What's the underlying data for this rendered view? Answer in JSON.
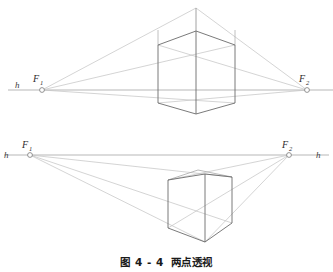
{
  "figure": {
    "caption_number": "图 4 - 4",
    "caption_title": "两点透视",
    "background_color": "#ffffff"
  },
  "colors": {
    "solid_edge": "#6b6b6b",
    "construction_line": "#bcbcbc",
    "horizon_line": "#9a9a9a",
    "label_text": "#2b2b2b",
    "marker_stroke": "#7a7a7a"
  },
  "diagrams": [
    {
      "id": "upper-diagram",
      "name": "worms-eye-two-point-perspective",
      "description": "Two-point perspective of a box straddling the horizon line",
      "horizon": {
        "label_left": "h",
        "y": 90,
        "x_start": 8,
        "x_end": 333
      },
      "vanishing_points": [
        {
          "name": "F1",
          "label": "F",
          "subscript": "1",
          "x": 42,
          "y": 90
        },
        {
          "name": "F2",
          "label": "F",
          "subscript": "2",
          "x": 307,
          "y": 90
        }
      ],
      "box": {
        "front_vertical_top_y": 31,
        "front_vertical_bottom_y": 114,
        "front_x": 196,
        "left_x": 158,
        "right_x": 235,
        "left_top_y": 45,
        "left_bottom_y": 103,
        "right_top_y": 45,
        "right_bottom_y": 103,
        "apex_x": 196,
        "apex_y": 8
      }
    },
    {
      "id": "lower-diagram",
      "name": "birds-eye-two-point-perspective",
      "description": "Two-point perspective of a cube below the horizon line",
      "horizon": {
        "label_left": "h",
        "label_right": "h",
        "y": 155,
        "x_start": 4,
        "x_end": 329
      },
      "vanishing_points": [
        {
          "name": "F1",
          "label": "F",
          "subscript": "1",
          "x": 30,
          "y": 155
        },
        {
          "name": "F2",
          "label": "F",
          "subscript": "2",
          "x": 289,
          "y": 155
        }
      ],
      "cube": {
        "front_x": 205,
        "front_top_y": 174,
        "front_bottom_y": 242,
        "left_x": 168,
        "left_top_y": 180,
        "left_bottom_y": 228,
        "right_x": 232,
        "right_top_y": 177,
        "right_bottom_y": 223,
        "back_top_x": 198,
        "back_top_y": 170
      }
    }
  ],
  "labels": {
    "h": "h",
    "F": "F",
    "one": "1",
    "two": "2"
  }
}
